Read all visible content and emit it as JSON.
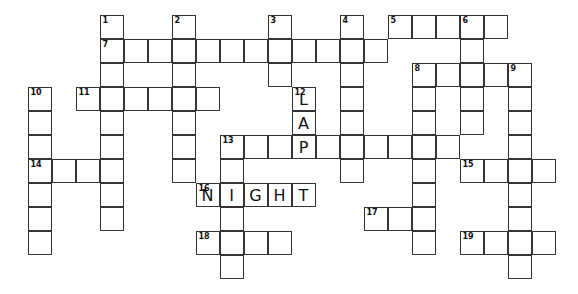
{
  "puzzle": {
    "type": "crossword",
    "grid": {
      "origin_x": 28,
      "origin_y": 15,
      "cell_size": 24
    },
    "cells": [
      {
        "r": 0,
        "c": 3,
        "n": "1"
      },
      {
        "r": 1,
        "c": 3,
        "n": "7"
      },
      {
        "r": 2,
        "c": 3
      },
      {
        "r": 3,
        "c": 3
      },
      {
        "r": 4,
        "c": 3
      },
      {
        "r": 5,
        "c": 3
      },
      {
        "r": 6,
        "c": 3
      },
      {
        "r": 7,
        "c": 3
      },
      {
        "r": 8,
        "c": 3
      },
      {
        "r": 0,
        "c": 6,
        "n": "2"
      },
      {
        "r": 1,
        "c": 6
      },
      {
        "r": 2,
        "c": 6
      },
      {
        "r": 3,
        "c": 6
      },
      {
        "r": 4,
        "c": 6
      },
      {
        "r": 5,
        "c": 6
      },
      {
        "r": 6,
        "c": 6
      },
      {
        "r": 0,
        "c": 10,
        "n": "3"
      },
      {
        "r": 1,
        "c": 10
      },
      {
        "r": 2,
        "c": 10
      },
      {
        "r": 0,
        "c": 13,
        "n": "4"
      },
      {
        "r": 1,
        "c": 13
      },
      {
        "r": 2,
        "c": 13
      },
      {
        "r": 3,
        "c": 13
      },
      {
        "r": 4,
        "c": 13
      },
      {
        "r": 5,
        "c": 13
      },
      {
        "r": 6,
        "c": 13
      },
      {
        "r": 0,
        "c": 15,
        "n": "5"
      },
      {
        "r": 0,
        "c": 16
      },
      {
        "r": 0,
        "c": 17
      },
      {
        "r": 0,
        "c": 18,
        "n": "6"
      },
      {
        "r": 0,
        "c": 19
      },
      {
        "r": 1,
        "c": 18
      },
      {
        "r": 2,
        "c": 18
      },
      {
        "r": 3,
        "c": 18
      },
      {
        "r": 4,
        "c": 18
      },
      {
        "r": 1,
        "c": 4
      },
      {
        "r": 1,
        "c": 5
      },
      {
        "r": 1,
        "c": 7
      },
      {
        "r": 1,
        "c": 8
      },
      {
        "r": 1,
        "c": 9
      },
      {
        "r": 1,
        "c": 11
      },
      {
        "r": 1,
        "c": 12
      },
      {
        "r": 1,
        "c": 14
      },
      {
        "r": 2,
        "c": 16,
        "n": "8"
      },
      {
        "r": 2,
        "c": 17
      },
      {
        "r": 2,
        "c": 19
      },
      {
        "r": 2,
        "c": 20,
        "n": "9"
      },
      {
        "r": 3,
        "c": 16
      },
      {
        "r": 4,
        "c": 16
      },
      {
        "r": 5,
        "c": 16
      },
      {
        "r": 6,
        "c": 16
      },
      {
        "r": 7,
        "c": 16
      },
      {
        "r": 8,
        "c": 16
      },
      {
        "r": 9,
        "c": 16
      },
      {
        "r": 3,
        "c": 20
      },
      {
        "r": 4,
        "c": 20
      },
      {
        "r": 5,
        "c": 20
      },
      {
        "r": 6,
        "c": 20
      },
      {
        "r": 7,
        "c": 20
      },
      {
        "r": 8,
        "c": 20
      },
      {
        "r": 9,
        "c": 20
      },
      {
        "r": 10,
        "c": 20
      },
      {
        "r": 3,
        "c": 0,
        "n": "10"
      },
      {
        "r": 4,
        "c": 0
      },
      {
        "r": 5,
        "c": 0
      },
      {
        "r": 6,
        "c": 0,
        "n": "14"
      },
      {
        "r": 7,
        "c": 0
      },
      {
        "r": 8,
        "c": 0
      },
      {
        "r": 9,
        "c": 0
      },
      {
        "r": 3,
        "c": 2,
        "n": "11"
      },
      {
        "r": 3,
        "c": 4
      },
      {
        "r": 3,
        "c": 5
      },
      {
        "r": 3,
        "c": 7
      },
      {
        "r": 3,
        "c": 11,
        "n": "12",
        "l": "L"
      },
      {
        "r": 4,
        "c": 11,
        "l": "A"
      },
      {
        "r": 5,
        "c": 11,
        "l": "P"
      },
      {
        "r": 5,
        "c": 8,
        "n": "13"
      },
      {
        "r": 5,
        "c": 9
      },
      {
        "r": 5,
        "c": 10
      },
      {
        "r": 5,
        "c": 12
      },
      {
        "r": 5,
        "c": 14
      },
      {
        "r": 5,
        "c": 15
      },
      {
        "r": 5,
        "c": 17
      },
      {
        "r": 6,
        "c": 8
      },
      {
        "r": 7,
        "c": 8
      },
      {
        "r": 8,
        "c": 8
      },
      {
        "r": 9,
        "c": 8
      },
      {
        "r": 10,
        "c": 8
      },
      {
        "r": 6,
        "c": 1
      },
      {
        "r": 6,
        "c": 2
      },
      {
        "r": 6,
        "c": 18,
        "n": "15"
      },
      {
        "r": 6,
        "c": 19
      },
      {
        "r": 6,
        "c": 21
      },
      {
        "r": 7,
        "c": 7,
        "n": "16",
        "l": "N"
      },
      {
        "r": 7,
        "c": 8,
        "l": "I"
      },
      {
        "r": 7,
        "c": 9,
        "l": "G"
      },
      {
        "r": 7,
        "c": 10,
        "l": "H"
      },
      {
        "r": 7,
        "c": 11,
        "l": "T"
      },
      {
        "r": 8,
        "c": 14,
        "n": "17"
      },
      {
        "r": 8,
        "c": 15
      },
      {
        "r": 9,
        "c": 7,
        "n": "18"
      },
      {
        "r": 9,
        "c": 9
      },
      {
        "r": 9,
        "c": 10
      },
      {
        "r": 9,
        "c": 18,
        "n": "19"
      },
      {
        "r": 9,
        "c": 19
      },
      {
        "r": 9,
        "c": 21
      }
    ],
    "filled_answers": {
      "12_down": "LAP",
      "16_across": "NIGHT"
    },
    "colors": {
      "border": "#333333",
      "cell_bg": "#ffffff",
      "text": "#111111"
    }
  }
}
